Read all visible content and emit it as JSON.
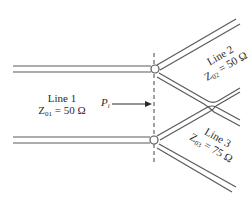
{
  "diagram": {
    "type": "transmission-line-junction",
    "line1": {
      "name": "Line 1",
      "impedance_label": "Z",
      "impedance_sub": "01",
      "impedance_value": "= 50 Ω"
    },
    "line2": {
      "name": "Line 2",
      "impedance_label": "Z",
      "impedance_sub": "02",
      "impedance_value": "= 50 Ω"
    },
    "line3": {
      "name": "Line 3",
      "impedance_label": "Z",
      "impedance_sub": "03",
      "impedance_value": "= 75 Ω"
    },
    "incident_power": {
      "label": "P",
      "sub": "i"
    },
    "colors": {
      "line": "#555555",
      "text": "#2a2a2a",
      "dash": "#444444"
    }
  }
}
